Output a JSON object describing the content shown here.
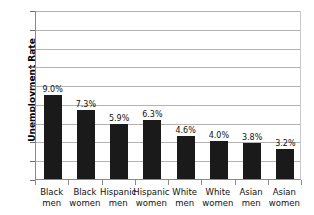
{
  "chart_data": {
    "type": "bar",
    "title": "",
    "subtitle": "",
    "xlabel": "",
    "ylabel": "Unemployment Rate",
    "ylim": [
      0,
      18
    ],
    "ytick_values": [
      0,
      2,
      4,
      6,
      8,
      10,
      12,
      14,
      16,
      18
    ],
    "ytick_labels": [
      "0",
      "2",
      "4",
      "6",
      "8",
      "10",
      "12",
      "14",
      "16",
      "18"
    ],
    "grid": true,
    "legend": false,
    "legend_position": "none",
    "orientation": "vertical",
    "bar_color": "#1a1a1a",
    "gridline_color": "#b3b3b3",
    "axis_color": "#8a8a8a",
    "background_color": "#ffffff",
    "categories": [
      "Black men",
      "Black women",
      "Hispanic men",
      "Hispanic women",
      "White men",
      "White women",
      "Asian men",
      "Asian women"
    ],
    "category_lines": [
      [
        "Black",
        "men"
      ],
      [
        "Black",
        "women"
      ],
      [
        "Hispanic",
        "men"
      ],
      [
        "Hispanic",
        "women"
      ],
      [
        "White",
        "men"
      ],
      [
        "White",
        "women"
      ],
      [
        "Asian",
        "men"
      ],
      [
        "Asian",
        "women"
      ]
    ],
    "values": [
      9.0,
      7.3,
      5.9,
      6.3,
      4.6,
      4.0,
      3.8,
      3.2
    ],
    "data_labels": [
      "9.0%",
      "7.3%",
      "5.9%",
      "6.3%",
      "4.6%",
      "4.0%",
      "3.8%",
      "3.2%"
    ]
  }
}
